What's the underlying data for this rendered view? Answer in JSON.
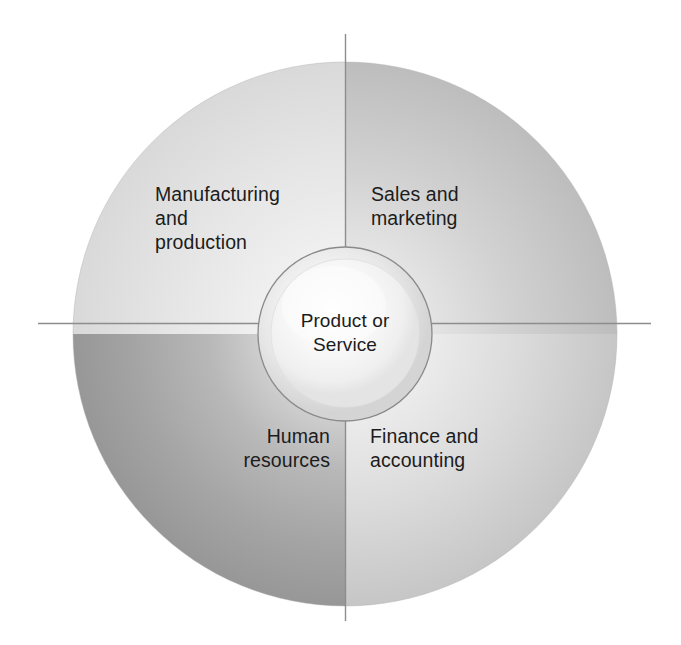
{
  "diagram": {
    "type": "quadrant-circle",
    "center": {
      "label": "Product or\nService"
    },
    "quadrants": [
      {
        "position": "top-left",
        "label": "Manufacturing\nand\nproduction",
        "fill_center": "#f4f4f4",
        "fill_edge": "#dcdcdc"
      },
      {
        "position": "top-right",
        "label": "Sales and\nmarketing",
        "fill_center": "#f2f2f2",
        "fill_edge": "#c2c2c2"
      },
      {
        "position": "bottom-left",
        "label": "Human\nresources",
        "fill_center": "#e8e8e8",
        "fill_edge": "#9a9a9a"
      },
      {
        "position": "bottom-right",
        "label": "Finance and\naccounting",
        "fill_center": "#f4f4f4",
        "fill_edge": "#c8c8c8"
      }
    ],
    "colors": {
      "text": "#1c1c1c",
      "axis_line": "#8d8d8d",
      "outline": "#8a8a8a",
      "background": "#ffffff",
      "inner_circle_center": "#fbfbfb",
      "inner_circle_edge": "#d8d8d8"
    },
    "geometry": {
      "center_x": 345,
      "center_y": 334,
      "outer_radius": 272,
      "inner_radius": 87
    },
    "icons": {
      "vertical_axis": "vertical-axis-line",
      "horizontal_axis": "horizontal-axis-line"
    }
  }
}
